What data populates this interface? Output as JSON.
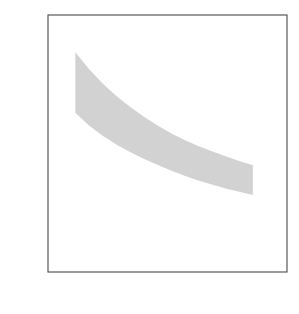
{
  "chart_data": {
    "type": "line",
    "title": "",
    "xlabel": "Lattice constant (µm)",
    "ylabel": "Frequency (THz)",
    "xlim": [
      200,
      550
    ],
    "ylim": [
      0,
      1.0
    ],
    "xticks": [
      200,
      300,
      400,
      500
    ],
    "xtick_labels": [
      "200",
      "300",
      "400",
      "500"
    ],
    "yticks": [
      0,
      0.2,
      0.4,
      0.6,
      0.8,
      1.0
    ],
    "ytick_labels": [
      "0",
      "0.2",
      "0.4",
      "0.6",
      "0.8",
      "1.0"
    ],
    "minor_xticks": [
      250,
      350,
      450
    ],
    "minor_yticks": [
      0.1,
      0.3,
      0.5,
      0.7,
      0.9
    ],
    "grid": false,
    "legend_position": "top-center",
    "x": [
      240,
      260,
      280,
      300,
      320,
      340,
      360,
      380,
      400,
      420,
      440,
      460,
      480,
      500
    ],
    "series": [
      {
        "name": "Higher band edge",
        "marker": "circle",
        "values": [
          0.855,
          0.79,
          0.733,
          0.685,
          0.643,
          0.605,
          0.571,
          0.54,
          0.514,
          0.49,
          0.47,
          0.45,
          0.432,
          0.415
        ]
      },
      {
        "name": "Lower band edge",
        "marker": "diamond",
        "values": [
          0.62,
          0.57,
          0.53,
          0.496,
          0.467,
          0.441,
          0.417,
          0.395,
          0.375,
          0.356,
          0.34,
          0.325,
          0.312,
          0.3
        ]
      }
    ],
    "annotations": [
      {
        "text": "Complete photonic band gap",
        "arrow_tip_x": 340,
        "arrow_tip_y": 0.5
      }
    ],
    "fill_between_label": "Complete photonic band gap",
    "colors": {
      "band_fill": "#d2d2d2",
      "curve": "#111111",
      "axis": "#4a4a4a",
      "text": "#1a1a1a",
      "background": "#ffffff"
    }
  }
}
